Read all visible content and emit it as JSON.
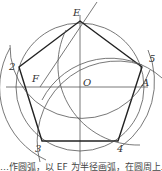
{
  "diagram": {
    "points": {
      "E": "E",
      "O": "O",
      "A": "A",
      "F": "F",
      "v2": "2",
      "v3": "3",
      "v4": "4",
      "v5": "5"
    },
    "caption": "…作圆弧，以 EF 为半径画弧，在圆周上…",
    "colors": {
      "stroke": "#2a2a2a",
      "background": "#ffffff"
    }
  }
}
